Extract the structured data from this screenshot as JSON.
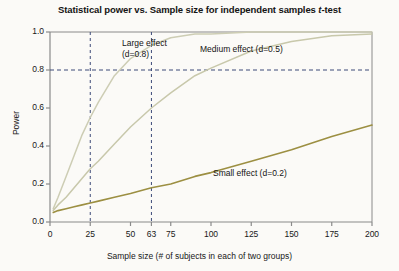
{
  "chart_data": {
    "type": "line",
    "title": "Statistical power vs. Sample size for independent samples t-test",
    "title_plain": "Statistical power vs. Sample size for independent samples ",
    "title_italic": "t",
    "title_tail": "-test",
    "xlabel": "Sample size (# of subjects in each of two groups)",
    "ylabel": "Power",
    "xlim": [
      0,
      200
    ],
    "ylim": [
      0.0,
      1.0
    ],
    "grid": false,
    "legend_position": "inline-annotations",
    "xticks": [
      0,
      25,
      50,
      63,
      75,
      100,
      125,
      150,
      175,
      200
    ],
    "xtick_labels": [
      "0",
      "25",
      "50",
      "63",
      "75",
      "100",
      "125",
      "150",
      "175",
      "200"
    ],
    "yticks": [
      0.0,
      0.2,
      0.4,
      0.6,
      0.8,
      1.0
    ],
    "ytick_labels": [
      "0.0",
      "0.2",
      "0.4",
      "0.6",
      "0.8",
      "1.0"
    ],
    "x": [
      2,
      5,
      10,
      15,
      20,
      25,
      30,
      40,
      50,
      63,
      75,
      90,
      100,
      125,
      150,
      175,
      200
    ],
    "series": [
      {
        "name": "Large effect (d=0.8)",
        "label_line1": "Large effect",
        "label_line2": "(d=0.8)",
        "effect_size": 0.8,
        "color": "#cdcdb4",
        "values": [
          0.07,
          0.13,
          0.24,
          0.35,
          0.46,
          0.55,
          0.63,
          0.77,
          0.86,
          0.93,
          0.97,
          0.99,
          0.99,
          1.0,
          1.0,
          1.0,
          1.0
        ]
      },
      {
        "name": "Medium effect (d=0.5)",
        "label_line1": "Medium effect (d=0.5)",
        "effect_size": 0.5,
        "color": "#c8c8ab",
        "values": [
          0.06,
          0.09,
          0.13,
          0.18,
          0.23,
          0.28,
          0.32,
          0.41,
          0.5,
          0.6,
          0.68,
          0.77,
          0.81,
          0.9,
          0.95,
          0.98,
          0.99
        ]
      },
      {
        "name": "Small effect (d=0.2)",
        "label_line1": "Small effect (d=0.2)",
        "effect_size": 0.2,
        "color": "#9c8f42",
        "values": [
          0.05,
          0.06,
          0.07,
          0.08,
          0.09,
          0.1,
          0.11,
          0.13,
          0.15,
          0.18,
          0.2,
          0.24,
          0.26,
          0.32,
          0.38,
          0.45,
          0.51
        ]
      }
    ],
    "reference_lines": [
      {
        "name": "power-0.8-line",
        "orientation": "horizontal",
        "value": 0.8,
        "style": "dashed"
      },
      {
        "name": "n-25-line",
        "orientation": "vertical",
        "value": 25,
        "style": "dashed"
      },
      {
        "name": "n-63-line",
        "orientation": "vertical",
        "value": 63,
        "style": "dashed"
      }
    ],
    "annotations": [
      {
        "name": "large-effect-annotation",
        "text": "Large effect (d=0.8)"
      },
      {
        "name": "medium-effect-annotation",
        "text": "Medium effect (d=0.5)"
      },
      {
        "name": "small-effect-annotation",
        "text": "Small effect (d=0.2)"
      }
    ],
    "colors": {
      "axis": "#8a8a8a",
      "dashed": "#3c4a78",
      "background": "#fbfaf7",
      "text": "#141414"
    }
  }
}
